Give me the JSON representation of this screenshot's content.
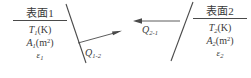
{
  "diagram": {
    "type": "radiation-heat-exchange-between-two-surfaces",
    "background_color": "#ffffff",
    "line_color": "#4a4a4a",
    "text_color": "#3a3a3a"
  },
  "surface1": {
    "title": "表面1",
    "temperature": {
      "symbol": "T",
      "subscript": "1",
      "unit": "(K)"
    },
    "area": {
      "symbol": "A",
      "subscript": "1",
      "unit": "(m",
      "unit_exponent": "2",
      "unit_close": ")"
    },
    "emissivity": {
      "symbol": "ε",
      "subscript": "1"
    }
  },
  "surface2": {
    "title": "表面2",
    "temperature": {
      "symbol": "T",
      "subscript": "2",
      "unit": "(K)"
    },
    "area": {
      "symbol": "A",
      "subscript": "2",
      "unit": "(m",
      "unit_exponent": "2",
      "unit_close": ")"
    },
    "emissivity": {
      "symbol": "ε",
      "subscript": "2"
    }
  },
  "flux_1_to_2": {
    "symbol": "Q",
    "subscript": "1-2",
    "direction": "right"
  },
  "flux_2_to_1": {
    "symbol": "Q",
    "subscript": "2-1",
    "direction": "left"
  }
}
